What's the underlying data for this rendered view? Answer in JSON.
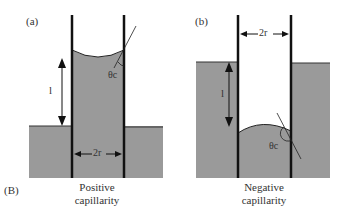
{
  "figure_label": "(B)",
  "panels": [
    {
      "id": "a",
      "label": "(a)",
      "caption_line1": "Positive",
      "caption_line2": "capillarity",
      "height_label": "l",
      "angle_label": "θc",
      "radius_label": "2r"
    },
    {
      "id": "b",
      "label": "(b)",
      "caption_line1": "Negative",
      "caption_line2": "capillarity",
      "height_label": "l",
      "angle_label": "θc",
      "radius_label": "2r"
    }
  ],
  "colors": {
    "liquid": "#9a9a9a",
    "wall": "#111111",
    "background": "#ffffff"
  }
}
